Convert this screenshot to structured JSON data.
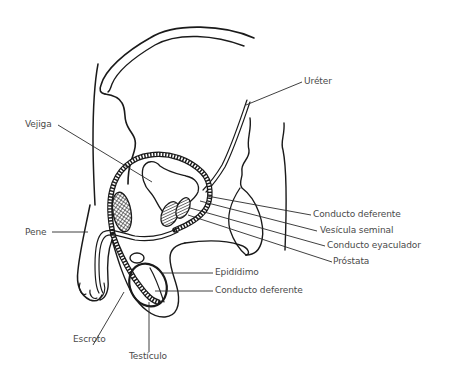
{
  "diagram": {
    "colors": {
      "background": "#ffffff",
      "line": "#1a1a1a",
      "label_text": "#4a4a4a"
    },
    "labels": [
      {
        "id": "ureter",
        "text": "Uréter"
      },
      {
        "id": "vejiga",
        "text": "Vejiga"
      },
      {
        "id": "conducto_deferente_top",
        "text": "Conducto deferente"
      },
      {
        "id": "vesicula_seminal",
        "text": "Vesícula seminal"
      },
      {
        "id": "conducto_eyaculador",
        "text": "Conducto eyaculador"
      },
      {
        "id": "prostata",
        "text": "Próstata"
      },
      {
        "id": "pene",
        "text": "Pene"
      },
      {
        "id": "epididimo",
        "text": "Epidídimo"
      },
      {
        "id": "conducto_deferente_bottom",
        "text": "Conducto deferente"
      },
      {
        "id": "escroto",
        "text": "Escroto"
      },
      {
        "id": "testiculo",
        "text": "Testículo"
      }
    ]
  }
}
